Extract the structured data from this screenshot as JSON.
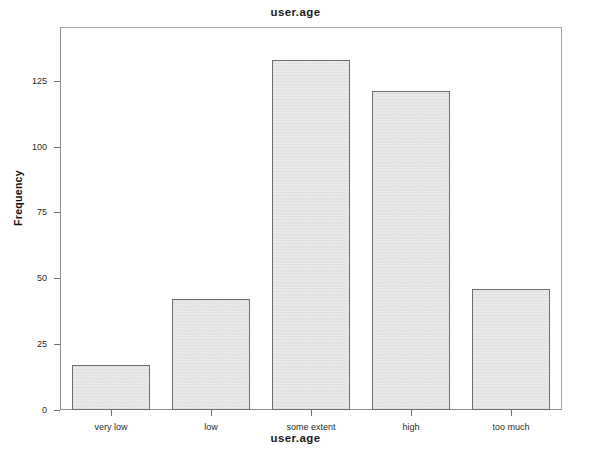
{
  "chart_data": {
    "type": "bar",
    "title": "user.age",
    "xlabel": "user.age",
    "ylabel": "Frequency",
    "categories": [
      "very low",
      "low",
      "some extent",
      "high",
      "too much"
    ],
    "values": [
      17,
      42,
      133,
      121,
      46
    ],
    "ylim": [
      0,
      145
    ],
    "yticks": [
      0,
      25,
      50,
      75,
      100,
      125
    ],
    "ytick_labels": [
      "0",
      "25",
      "50",
      "75",
      "100",
      "125"
    ],
    "grid": false,
    "legend": false,
    "bar_fill_color": "#e3e3e3",
    "bar_border_color": "#6e6e6e",
    "frame_color": "#8c8c8c",
    "background_color": "#ffffff"
  }
}
